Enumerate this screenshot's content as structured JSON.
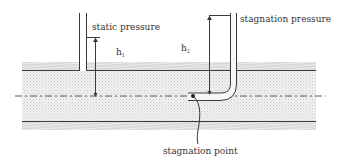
{
  "diagram": {
    "labels": {
      "static_pressure": "static pressure",
      "stagnation_pressure": "stagnation pressure",
      "h1": "h",
      "h1_sub": "1",
      "h2": "h",
      "h2_sub": "2",
      "stagnation_point": "stagnation point"
    },
    "colors": {
      "line": "#3a3a3a",
      "fluid_fill": "#e6e6e6",
      "hatch": "#c8c8c8",
      "text": "#333333"
    }
  }
}
